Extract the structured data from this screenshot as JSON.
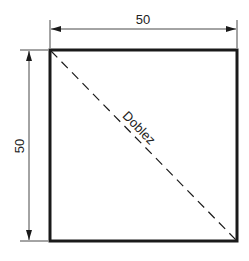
{
  "diagram": {
    "type": "technical-drawing",
    "shape": "square",
    "dimensions": {
      "width_label": "50",
      "height_label": "50"
    },
    "fold_line": {
      "label": "Doblez",
      "style": "dashed",
      "from": "top-left",
      "to": "bottom-right"
    },
    "colors": {
      "stroke": "#1a1a1a",
      "background": "#ffffff"
    }
  }
}
